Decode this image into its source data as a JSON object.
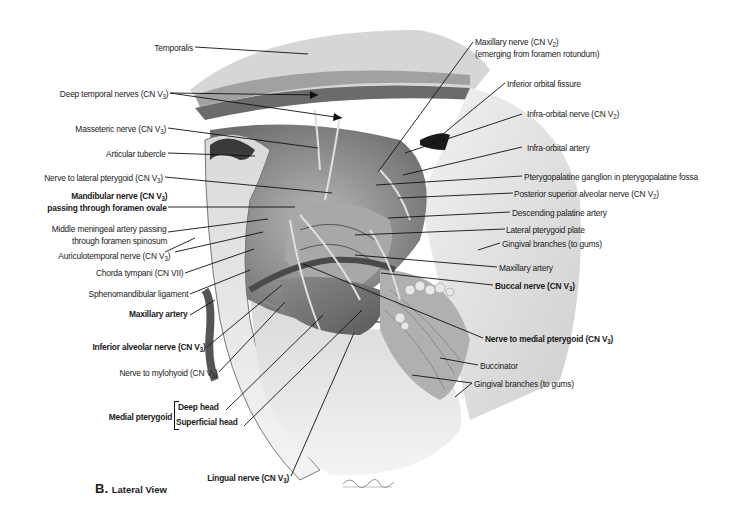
{
  "figure": {
    "caption_letter": "B.",
    "caption_text": "Lateral View",
    "signature": "D.Strebel"
  },
  "colors": {
    "background": "#ffffff",
    "label_text": "#1a1a1a",
    "leader_line": "#111111",
    "bone": "#e6e6e6",
    "muscle_dark": "#6a6a6a",
    "muscle_mid": "#9c9c9c",
    "shadow": "#3a3a3a"
  },
  "labels_left": [
    {
      "id": "temporalis",
      "text": "Temporalis",
      "sub": "",
      "close": "",
      "bold": false
    },
    {
      "id": "deep-temporal-nerves",
      "text": "Deep temporal nerves (CN V",
      "sub": "3",
      "close": ")",
      "bold": false
    },
    {
      "id": "masseteric-nerve",
      "text": "Masseteric nerve (CN V",
      "sub": "3",
      "close": ")",
      "bold": false
    },
    {
      "id": "articular-tubercle",
      "text": "Articular tubercle",
      "sub": "",
      "close": "",
      "bold": false
    },
    {
      "id": "nerve-to-lateral-pterygoid",
      "text": "Nerve to lateral pterygoid (CN V",
      "sub": "3",
      "close": ")",
      "bold": false
    },
    {
      "id": "mandibular-nerve",
      "text": "Mandibular nerve (CN V",
      "sub": "3",
      "close": ")",
      "line2": "passing through foramen ovale",
      "bold": true
    },
    {
      "id": "middle-meningeal-artery",
      "text": "Middle meningeal artery passing",
      "line2": "through foramen spinosum",
      "sub": "",
      "close": "",
      "bold": false
    },
    {
      "id": "auriculotemporal-nerve",
      "text": "Auriculotemporal nerve (CN V",
      "sub": "3",
      "close": ")",
      "bold": false
    },
    {
      "id": "chorda-tympani",
      "text": "Chorda tympani (CN VII)",
      "sub": "",
      "close": "",
      "bold": false
    },
    {
      "id": "sphenomandibular-ligament",
      "text": "Sphenomandibular ligament",
      "sub": "",
      "close": "",
      "bold": false
    },
    {
      "id": "maxillary-artery-left",
      "text": "Maxillary artery",
      "sub": "",
      "close": "",
      "bold": true
    },
    {
      "id": "inferior-alveolar-nerve",
      "text": "Inferior alveolar nerve (CN V",
      "sub": "3",
      "close": ")",
      "bold": true
    },
    {
      "id": "nerve-to-mylohyoid",
      "text": "Nerve to mylohyoid (CN V",
      "sub": "3",
      "close": ")",
      "bold": false
    },
    {
      "id": "medial-pterygoid",
      "text": "Medial pterygoid",
      "sub": "",
      "close": "",
      "bold": true
    },
    {
      "id": "deep-head",
      "text": "Deep head",
      "sub": "",
      "close": "",
      "bold": true
    },
    {
      "id": "superficial-head",
      "text": "Superficial head",
      "sub": "",
      "close": "",
      "bold": true
    },
    {
      "id": "lingual-nerve",
      "text": "Lingual nerve (CN V",
      "sub": "3",
      "close": ")",
      "bold": true
    }
  ],
  "labels_right": [
    {
      "id": "maxillary-nerve",
      "text": "Maxillary nerve (CN V",
      "sub": "2",
      "close": ")",
      "line2": "(emerging from foramen rotundum)",
      "bold": false
    },
    {
      "id": "inferior-orbital-fissure",
      "text": "Inferior orbital fissure",
      "sub": "",
      "close": "",
      "bold": false
    },
    {
      "id": "infra-orbital-nerve",
      "text": "Infra-orbital nerve (CN V",
      "sub": "2",
      "close": ")",
      "bold": false
    },
    {
      "id": "infra-orbital-artery",
      "text": "Infra-orbital artery",
      "sub": "",
      "close": "",
      "bold": false
    },
    {
      "id": "pterygopalatine-ganglion",
      "text": "Pterygopalatine ganglion in pterygopalatine fossa",
      "sub": "",
      "close": "",
      "bold": false
    },
    {
      "id": "posterior-superior-alveolar-nerve",
      "text": "Posterior superior alveolar nerve (CN V",
      "sub": "2",
      "close": ")",
      "bold": false
    },
    {
      "id": "descending-palatine-artery",
      "text": "Descending palatine artery",
      "sub": "",
      "close": "",
      "bold": false
    },
    {
      "id": "lateral-pterygoid-plate",
      "text": "Lateral pterygoid plate",
      "sub": "",
      "close": "",
      "bold": false
    },
    {
      "id": "gingival-branches-upper",
      "text": "Gingival branches (to gums)",
      "sub": "",
      "close": "",
      "bold": false
    },
    {
      "id": "maxillary-artery-right",
      "text": "Maxillary artery",
      "sub": "",
      "close": "",
      "bold": false
    },
    {
      "id": "buccal-nerve",
      "text": "Buccal nerve (CN V",
      "sub": "3",
      "close": ")",
      "bold": true
    },
    {
      "id": "nerve-to-medial-pterygoid",
      "text": "Nerve to medial pterygoid (CN V",
      "sub": "3",
      "close": ")",
      "bold": true
    },
    {
      "id": "buccinator",
      "text": "Buccinator",
      "sub": "",
      "close": "",
      "bold": false
    },
    {
      "id": "gingival-branches-lower",
      "text": "Gingival branches (to gums)",
      "sub": "",
      "close": "",
      "bold": false
    }
  ]
}
